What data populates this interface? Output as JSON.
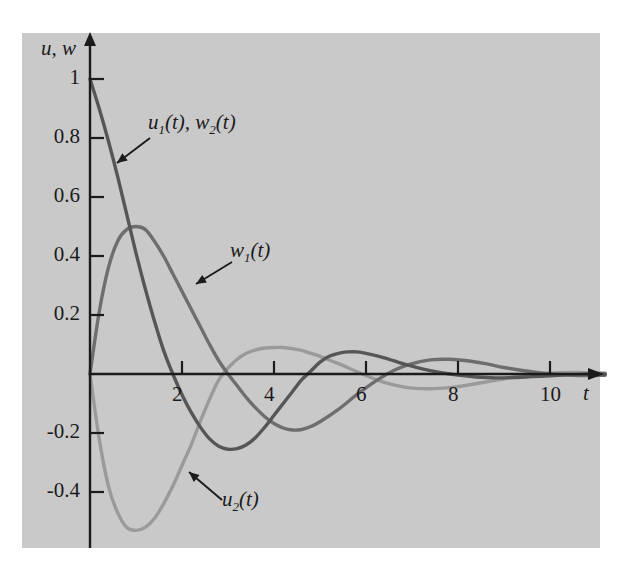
{
  "figure": {
    "background_color": "#c9c9c9",
    "page_color": "#ffffff",
    "axis_color": "#1b1b1b"
  },
  "axes": {
    "y_axis_label": "u, w",
    "x_axis_label": "t"
  },
  "labels": {
    "curve1": {
      "text": "u₁(t), w₂(t)",
      "name_plain": "u1(t), w2(t)"
    },
    "curve2": {
      "text": "w₁(t)",
      "name_plain": "w1(t)"
    },
    "curve3": {
      "text": "u₂(t)",
      "name_plain": "u2(t)"
    }
  },
  "chart_data": {
    "type": "line",
    "title": "",
    "xlabel": "t",
    "ylabel": "u, w",
    "xlim": [
      0,
      11.2
    ],
    "ylim": [
      -0.58,
      1.05
    ],
    "grid": false,
    "legend": "annotations",
    "xticks": [
      2,
      4,
      6,
      8,
      10
    ],
    "xtick_labels": [
      "2",
      "4",
      "6",
      "8",
      "10"
    ],
    "yticks": [
      1,
      0.8,
      0.6,
      0.4,
      0.2,
      -0.2,
      -0.4
    ],
    "ytick_labels": [
      "1",
      "0.8",
      "0.6",
      "0.4",
      "0.2",
      "-0.2",
      "-0.4"
    ],
    "series": [
      {
        "name": "u1(t), w2(t)",
        "color": "#565656",
        "linewidth": 3.4,
        "description": "Damped oscillation starting at 1, crossing zero near t=1.9, minimum about -0.25 near t=3.2, back up through zero near t=4.6, small maximum about 0.07 near t=5.8, decaying to 0",
        "x": [
          0,
          0.2,
          0.4,
          0.6,
          0.8,
          1.0,
          1.2,
          1.4,
          1.6,
          1.8,
          2.0,
          2.2,
          2.4,
          2.6,
          2.8,
          3.0,
          3.2,
          3.4,
          3.6,
          3.8,
          4.0,
          4.2,
          4.4,
          4.6,
          4.8,
          5.0,
          5.2,
          5.4,
          5.6,
          5.8,
          6.0,
          6.4,
          6.8,
          7.2,
          7.6,
          8.0,
          8.4,
          8.8,
          9.2,
          9.6,
          10.0,
          10.4,
          10.8,
          11.2
        ],
        "y": [
          1.0,
          0.9,
          0.79,
          0.67,
          0.54,
          0.41,
          0.29,
          0.18,
          0.08,
          0.0,
          -0.07,
          -0.13,
          -0.18,
          -0.22,
          -0.245,
          -0.255,
          -0.253,
          -0.24,
          -0.215,
          -0.18,
          -0.14,
          -0.1,
          -0.06,
          -0.02,
          0.01,
          0.04,
          0.06,
          0.07,
          0.075,
          0.075,
          0.07,
          0.055,
          0.035,
          0.018,
          0.005,
          -0.004,
          -0.01,
          -0.013,
          -0.012,
          -0.009,
          -0.006,
          -0.003,
          -0.001,
          0.0
        ]
      },
      {
        "name": "w1(t)",
        "color": "#6e6e6e",
        "linewidth": 3.4,
        "description": "Starts at 0, rises to maximum about 0.50 near t=1.1, crosses zero near t=3.0, minimum about -0.19 near t=4.4, crosses zero near t=6.1, small maximum about 0.05 near t=7.4, decaying to 0",
        "x": [
          0,
          0.2,
          0.4,
          0.6,
          0.8,
          1.0,
          1.2,
          1.4,
          1.6,
          1.8,
          2.0,
          2.2,
          2.4,
          2.6,
          2.8,
          3.0,
          3.2,
          3.4,
          3.6,
          3.8,
          4.0,
          4.2,
          4.4,
          4.6,
          4.8,
          5.0,
          5.4,
          5.8,
          6.2,
          6.6,
          7.0,
          7.4,
          7.8,
          8.2,
          8.6,
          9.0,
          9.4,
          9.8,
          10.2,
          10.6,
          11.2
        ],
        "y": [
          0.0,
          0.21,
          0.36,
          0.45,
          0.49,
          0.5,
          0.49,
          0.45,
          0.4,
          0.34,
          0.28,
          0.22,
          0.16,
          0.1,
          0.045,
          0.0,
          -0.04,
          -0.08,
          -0.115,
          -0.145,
          -0.168,
          -0.183,
          -0.19,
          -0.188,
          -0.178,
          -0.162,
          -0.12,
          -0.07,
          -0.025,
          0.012,
          0.035,
          0.048,
          0.05,
          0.045,
          0.035,
          0.022,
          0.012,
          0.004,
          -0.002,
          -0.005,
          -0.004
        ]
      },
      {
        "name": "u2(t)",
        "color": "#9a9a9a",
        "linewidth": 3.4,
        "description": "Starts at 0, plunges to minimum about -0.53 near t=1.1, crosses zero near t=2.6, maximum about 0.09 near t=4.2, crosses zero near t=5.6, shallow minimum about -0.05 near t=7.0, decaying to 0",
        "x": [
          0,
          0.2,
          0.4,
          0.6,
          0.8,
          1.0,
          1.2,
          1.4,
          1.6,
          1.8,
          2.0,
          2.2,
          2.4,
          2.6,
          2.8,
          3.0,
          3.2,
          3.4,
          3.6,
          3.8,
          4.0,
          4.2,
          4.4,
          4.6,
          4.8,
          5.0,
          5.4,
          5.8,
          6.2,
          6.6,
          7.0,
          7.4,
          7.8,
          8.2,
          8.6,
          9.0,
          9.4,
          9.8,
          10.2,
          10.6,
          11.2
        ],
        "y": [
          0.0,
          -0.22,
          -0.38,
          -0.47,
          -0.52,
          -0.53,
          -0.52,
          -0.49,
          -0.44,
          -0.38,
          -0.31,
          -0.24,
          -0.16,
          -0.085,
          -0.02,
          0.02,
          0.05,
          0.07,
          0.082,
          0.088,
          0.09,
          0.09,
          0.086,
          0.08,
          0.07,
          0.06,
          0.035,
          0.008,
          -0.018,
          -0.037,
          -0.048,
          -0.05,
          -0.046,
          -0.038,
          -0.027,
          -0.016,
          -0.007,
          0.0,
          0.004,
          0.005,
          0.003
        ]
      }
    ],
    "annotations": [
      {
        "text": "u1(t), w2(t)",
        "target_x": 0.75,
        "target_y": 0.81
      },
      {
        "text": "w1(t)",
        "target_x": 2.15,
        "target_y": 0.3
      },
      {
        "text": "u2(t)",
        "target_x": 2.55,
        "target_y": -0.33
      }
    ]
  }
}
